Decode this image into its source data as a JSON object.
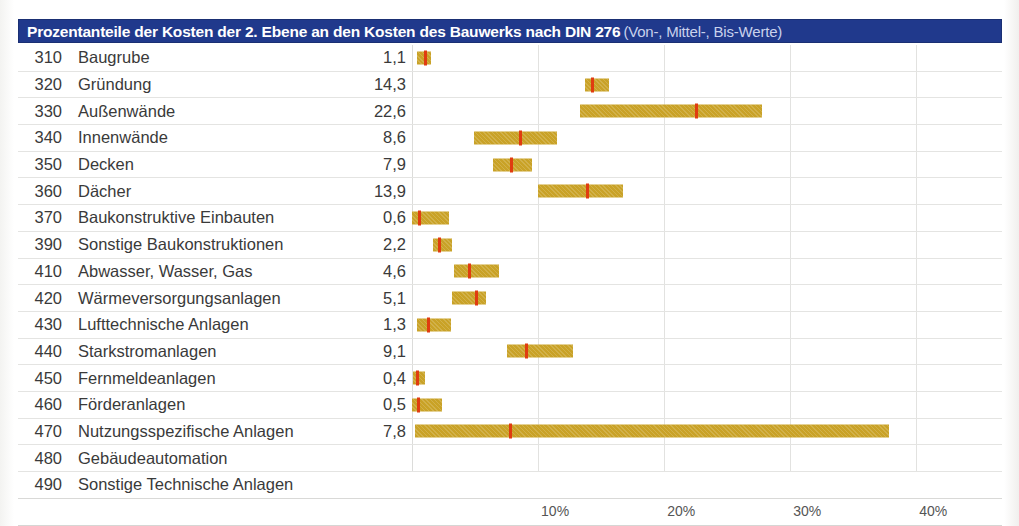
{
  "title": {
    "main": "Prozentanteile der Kosten der 2. Ebene an den Kosten des Bauwerks nach DIN 276",
    "sub": "(Von-, Mittel-, Bis-Werte)"
  },
  "colors": {
    "title_bar": "#20398c",
    "title_text": "#ffffff",
    "title_sub_text": "#c9d2ec",
    "bar": "#c9a227",
    "mid_mark": "#e03c10",
    "gridline": "#e2e2e0",
    "row_rule": "#e4e4e2"
  },
  "axis": {
    "min_percent": 0,
    "max_percent": 46.8,
    "ticks": [
      {
        "value": 10,
        "label": "10%"
      },
      {
        "value": 20,
        "label": "20%"
      },
      {
        "value": 30,
        "label": "30%"
      },
      {
        "value": 40,
        "label": "40%"
      }
    ]
  },
  "chart_data": {
    "type": "bar",
    "xlabel": "",
    "ylabel": "",
    "xlim": [
      0,
      46.8
    ],
    "grid": true,
    "legend": "none",
    "xtick_labels": [
      "10%",
      "20%",
      "30%",
      "40%"
    ],
    "xtick_values": [
      10,
      20,
      30,
      40
    ],
    "categories": [
      "310 Baugrube",
      "320 Gründung",
      "330 Außenwände",
      "340 Innenwände",
      "350 Decken",
      "360 Dächer",
      "370 Baukonstruktive Einbauten",
      "390 Sonstige Baukonstruktionen",
      "410 Abwasser, Wasser, Gas",
      "420 Wärmeversorgungsanlagen",
      "430 Lufttechnische Anlagen",
      "440 Starkstromanlagen",
      "450 Fernmeldeanlagen",
      "460 Förderanlagen",
      "470 Nutzungsspezifische Anlagen",
      "480 Gebäudeautomation",
      "490 Sonstige Technische Anlagen"
    ],
    "values": [
      1.1,
      14.3,
      22.6,
      8.6,
      7.9,
      13.9,
      0.6,
      2.2,
      4.6,
      5.1,
      1.3,
      9.1,
      0.4,
      0.5,
      7.8,
      null,
      null
    ],
    "series": [
      {
        "name": "Von-Wert",
        "values": [
          0.4,
          13.7,
          13.3,
          4.9,
          6.4,
          10.0,
          0.0,
          1.7,
          3.3,
          3.2,
          0.4,
          7.5,
          0.1,
          0.0,
          0.2,
          null,
          null
        ]
      },
      {
        "name": "Mittel-Wert",
        "values": [
          1.1,
          14.3,
          22.6,
          8.6,
          7.9,
          13.9,
          0.6,
          2.2,
          4.6,
          5.1,
          1.3,
          9.1,
          0.4,
          0.5,
          7.8,
          null,
          null
        ]
      },
      {
        "name": "Bis-Wert",
        "values": [
          1.5,
          15.6,
          27.8,
          11.5,
          9.5,
          16.7,
          2.9,
          3.2,
          6.9,
          5.9,
          3.1,
          12.8,
          1.0,
          2.4,
          37.8,
          null,
          null
        ]
      }
    ]
  },
  "rows": [
    {
      "code": "310",
      "label": "Baugrube",
      "value": "1,1",
      "von": 0.4,
      "mittel": 1.1,
      "bis": 1.5
    },
    {
      "code": "320",
      "label": "Gründung",
      "value": "14,3",
      "von": 13.7,
      "mittel": 14.3,
      "bis": 15.6
    },
    {
      "code": "330",
      "label": "Außenwände",
      "value": "22,6",
      "von": 13.3,
      "mittel": 22.6,
      "bis": 27.8
    },
    {
      "code": "340",
      "label": "Innenwände",
      "value": "8,6",
      "von": 4.9,
      "mittel": 8.6,
      "bis": 11.5
    },
    {
      "code": "350",
      "label": "Decken",
      "value": "7,9",
      "von": 6.4,
      "mittel": 7.9,
      "bis": 9.5
    },
    {
      "code": "360",
      "label": "Dächer",
      "value": "13,9",
      "von": 10.0,
      "mittel": 13.9,
      "bis": 16.7
    },
    {
      "code": "370",
      "label": "Baukonstruktive Einbauten",
      "value": "0,6",
      "von": 0.0,
      "mittel": 0.6,
      "bis": 2.9
    },
    {
      "code": "390",
      "label": "Sonstige Baukonstruktionen",
      "value": "2,2",
      "von": 1.7,
      "mittel": 2.2,
      "bis": 3.2
    },
    {
      "code": "410",
      "label": "Abwasser, Wasser, Gas",
      "value": "4,6",
      "von": 3.3,
      "mittel": 4.6,
      "bis": 6.9
    },
    {
      "code": "420",
      "label": "Wärmeversorgungsanlagen",
      "value": "5,1",
      "von": 3.2,
      "mittel": 5.1,
      "bis": 5.9
    },
    {
      "code": "430",
      "label": "Lufttechnische Anlagen",
      "value": "1,3",
      "von": 0.4,
      "mittel": 1.3,
      "bis": 3.1
    },
    {
      "code": "440",
      "label": "Starkstromanlagen",
      "value": "9,1",
      "von": 7.5,
      "mittel": 9.1,
      "bis": 12.8
    },
    {
      "code": "450",
      "label": "Fernmeldeanlagen",
      "value": "0,4",
      "von": 0.1,
      "mittel": 0.4,
      "bis": 1.0
    },
    {
      "code": "460",
      "label": "Förderanlagen",
      "value": "0,5",
      "von": 0.0,
      "mittel": 0.5,
      "bis": 2.4
    },
    {
      "code": "470",
      "label": "Nutzungsspezifische Anlagen",
      "value": "7,8",
      "von": 0.2,
      "mittel": 7.8,
      "bis": 37.8
    },
    {
      "code": "480",
      "label": "Gebäudeautomation",
      "value": "",
      "von": null,
      "mittel": null,
      "bis": null
    },
    {
      "code": "490",
      "label": "Sonstige Technische Anlagen",
      "value": "",
      "von": null,
      "mittel": null,
      "bis": null
    }
  ]
}
